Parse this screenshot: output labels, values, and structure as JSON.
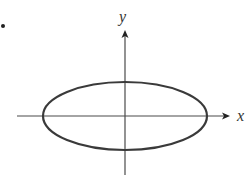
{
  "diagram": {
    "type": "ellipse-on-axes",
    "bullet": "•",
    "axes": {
      "x_label": "x",
      "y_label": "y"
    },
    "ellipse": {
      "center": [
        125,
        116
      ],
      "rx": 82,
      "ry": 34
    },
    "colors": {
      "ellipse_stroke": "#3a3a3a",
      "axis_stroke": "#4a4a4a",
      "label": "#333333"
    }
  }
}
